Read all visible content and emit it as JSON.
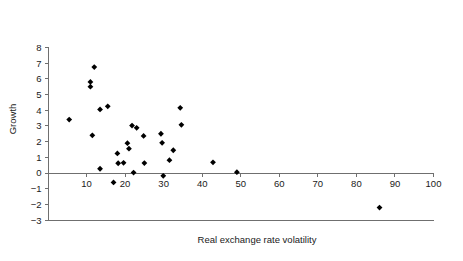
{
  "chart_data": {
    "type": "scatter",
    "title": "",
    "xlabel": "Real exchange rate volatility",
    "ylabel": "Growth",
    "xlim": [
      0,
      100
    ],
    "ylim": [
      -3,
      8
    ],
    "xticks": [
      10,
      20,
      30,
      40,
      50,
      60,
      70,
      80,
      90,
      100
    ],
    "yticks": [
      -3,
      -2,
      -1,
      0,
      1,
      2,
      3,
      4,
      5,
      6,
      7,
      8
    ],
    "grid": false,
    "legend": null,
    "marker": "diamond",
    "marker_color": "#000000",
    "points": [
      {
        "x": 5.5,
        "y": 3.4
      },
      {
        "x": 11.0,
        "y": 5.8
      },
      {
        "x": 11.0,
        "y": 5.5
      },
      {
        "x": 11.5,
        "y": 2.4
      },
      {
        "x": 12.0,
        "y": 6.75
      },
      {
        "x": 13.5,
        "y": 4.05
      },
      {
        "x": 13.5,
        "y": 0.27
      },
      {
        "x": 15.5,
        "y": 4.25
      },
      {
        "x": 17.0,
        "y": -0.6
      },
      {
        "x": 18.0,
        "y": 1.25
      },
      {
        "x": 18.2,
        "y": 0.62
      },
      {
        "x": 19.6,
        "y": 0.65
      },
      {
        "x": 20.6,
        "y": 1.9
      },
      {
        "x": 21.0,
        "y": 1.55
      },
      {
        "x": 21.8,
        "y": 3.02
      },
      {
        "x": 22.2,
        "y": 0.03
      },
      {
        "x": 23.0,
        "y": 2.88
      },
      {
        "x": 24.8,
        "y": 2.36
      },
      {
        "x": 25.0,
        "y": 0.63
      },
      {
        "x": 29.3,
        "y": 2.5
      },
      {
        "x": 29.6,
        "y": 1.92
      },
      {
        "x": 29.9,
        "y": -0.18
      },
      {
        "x": 31.5,
        "y": 0.82
      },
      {
        "x": 32.5,
        "y": 1.45
      },
      {
        "x": 34.3,
        "y": 4.15
      },
      {
        "x": 34.6,
        "y": 3.07
      },
      {
        "x": 42.8,
        "y": 0.68
      },
      {
        "x": 49.0,
        "y": 0.05
      },
      {
        "x": 86.0,
        "y": -2.2
      }
    ]
  },
  "axis": {
    "x_tick_labels": [
      "10",
      "20",
      "30",
      "40",
      "50",
      "60",
      "70",
      "80",
      "90",
      "100"
    ],
    "y_tick_labels": [
      "8",
      "7",
      "6",
      "5",
      "4",
      "3",
      "2",
      "1",
      "0",
      "−1",
      "−2",
      "−3"
    ],
    "x_title": "Real exchange rate volatility",
    "y_title": "Growth"
  },
  "colors": {
    "axis": "#6f6f6f",
    "text": "#1a1a1a",
    "marker": "#000000",
    "background": "#ffffff"
  }
}
